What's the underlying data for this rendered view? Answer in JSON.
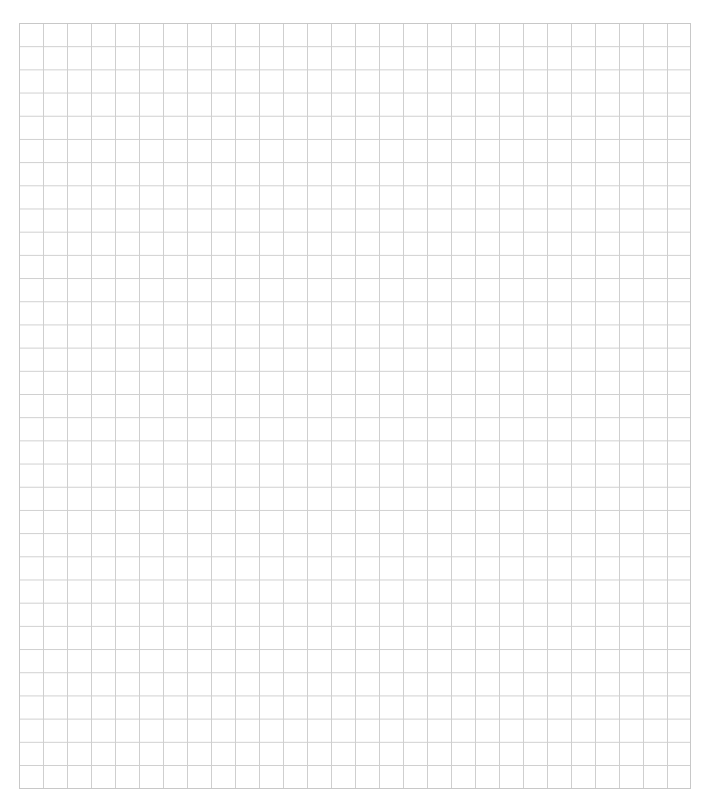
{
  "page": {
    "header_text": "",
    "grid": {
      "columns": 28,
      "rows": 33,
      "cell_width_px": 24,
      "cell_height_px": 23,
      "line_color": "#cfcfcf",
      "background_color": "#ffffff"
    }
  }
}
